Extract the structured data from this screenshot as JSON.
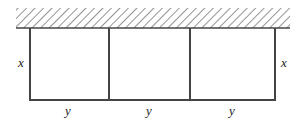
{
  "diagram": {
    "type": "fence-enclosure",
    "wall": {
      "pattern": "hatched"
    },
    "pens": 3,
    "labels": {
      "left_side": "x",
      "right_side": "x",
      "bottom": [
        "y",
        "y",
        "y"
      ]
    },
    "colors": {
      "line": "#444444",
      "hatch": "#666666",
      "background": "#ffffff"
    }
  }
}
